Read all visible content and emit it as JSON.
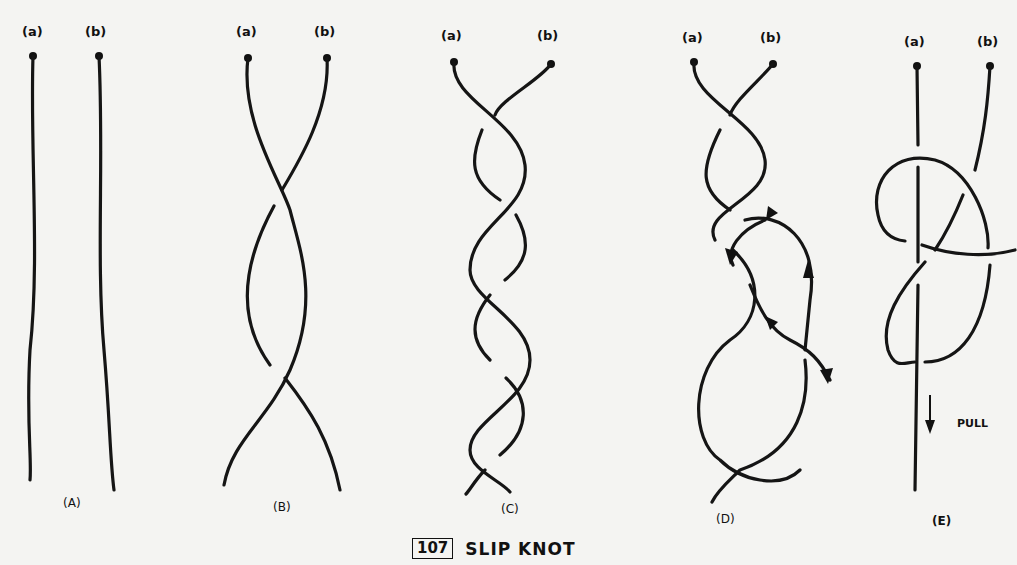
{
  "figure": {
    "number": "107",
    "title": "SLIP KNOT",
    "end_labels": {
      "a": "(a)",
      "b": "(b)"
    },
    "panels": [
      {
        "id": "A",
        "label": "(A)",
        "description": "two parallel strands"
      },
      {
        "id": "B",
        "label": "(B)",
        "description": "strands twisted once"
      },
      {
        "id": "C",
        "label": "(C)",
        "description": "strands twisted multiple times"
      },
      {
        "id": "D",
        "label": "(D)",
        "description": "end threaded back with arrows showing path"
      },
      {
        "id": "E",
        "label": "(E)",
        "description": "finished slip knot"
      }
    ],
    "pull_label": "PULL"
  }
}
